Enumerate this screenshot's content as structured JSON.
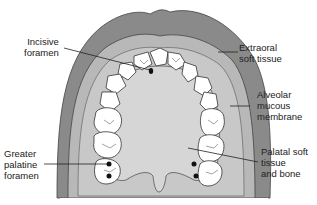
{
  "diagram": {
    "colors": {
      "extraoral": "#8a8a8a",
      "alveolar": "#b8b8b8",
      "palate": "#d4d4d4",
      "gingiva_band": "#c4c4c4",
      "tooth": "#ffffff",
      "outline": "#333333",
      "foramen": "#111111",
      "background": "#ffffff"
    },
    "labels": [
      {
        "id": "incisive-foramen",
        "text": "Incisive\nforamen"
      },
      {
        "id": "extraoral-soft-tissue",
        "text": "Extraoral\nsoft tissue"
      },
      {
        "id": "alveolar-mucous-membrane",
        "text": "Alveolar\nmucous\nmembrane"
      },
      {
        "id": "greater-palatine-foramen",
        "text": "Greater\npalatine\nforamen"
      },
      {
        "id": "palatal-soft-tissue-and-bone",
        "text": "Palatal soft\ntissue\nand bone"
      }
    ]
  }
}
